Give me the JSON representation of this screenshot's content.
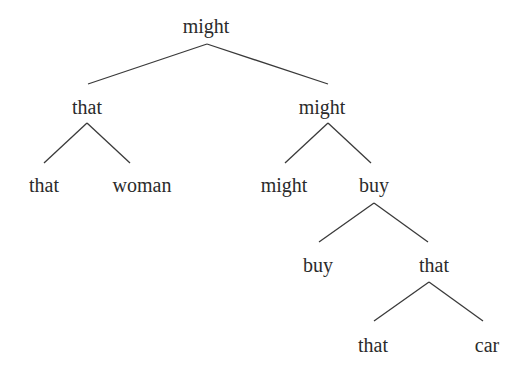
{
  "tree": {
    "root": "might",
    "left": {
      "label": "that",
      "children": [
        "that",
        "woman"
      ]
    },
    "right": {
      "label": "might",
      "children": {
        "left": "might",
        "right": {
          "label": "buy",
          "children": {
            "left": "buy",
            "right": {
              "label": "that",
              "children": [
                "that",
                "car"
              ]
            }
          }
        }
      }
    }
  },
  "style": {
    "line_color": "#3a3a3a",
    "text_color": "#2b2b2b"
  }
}
